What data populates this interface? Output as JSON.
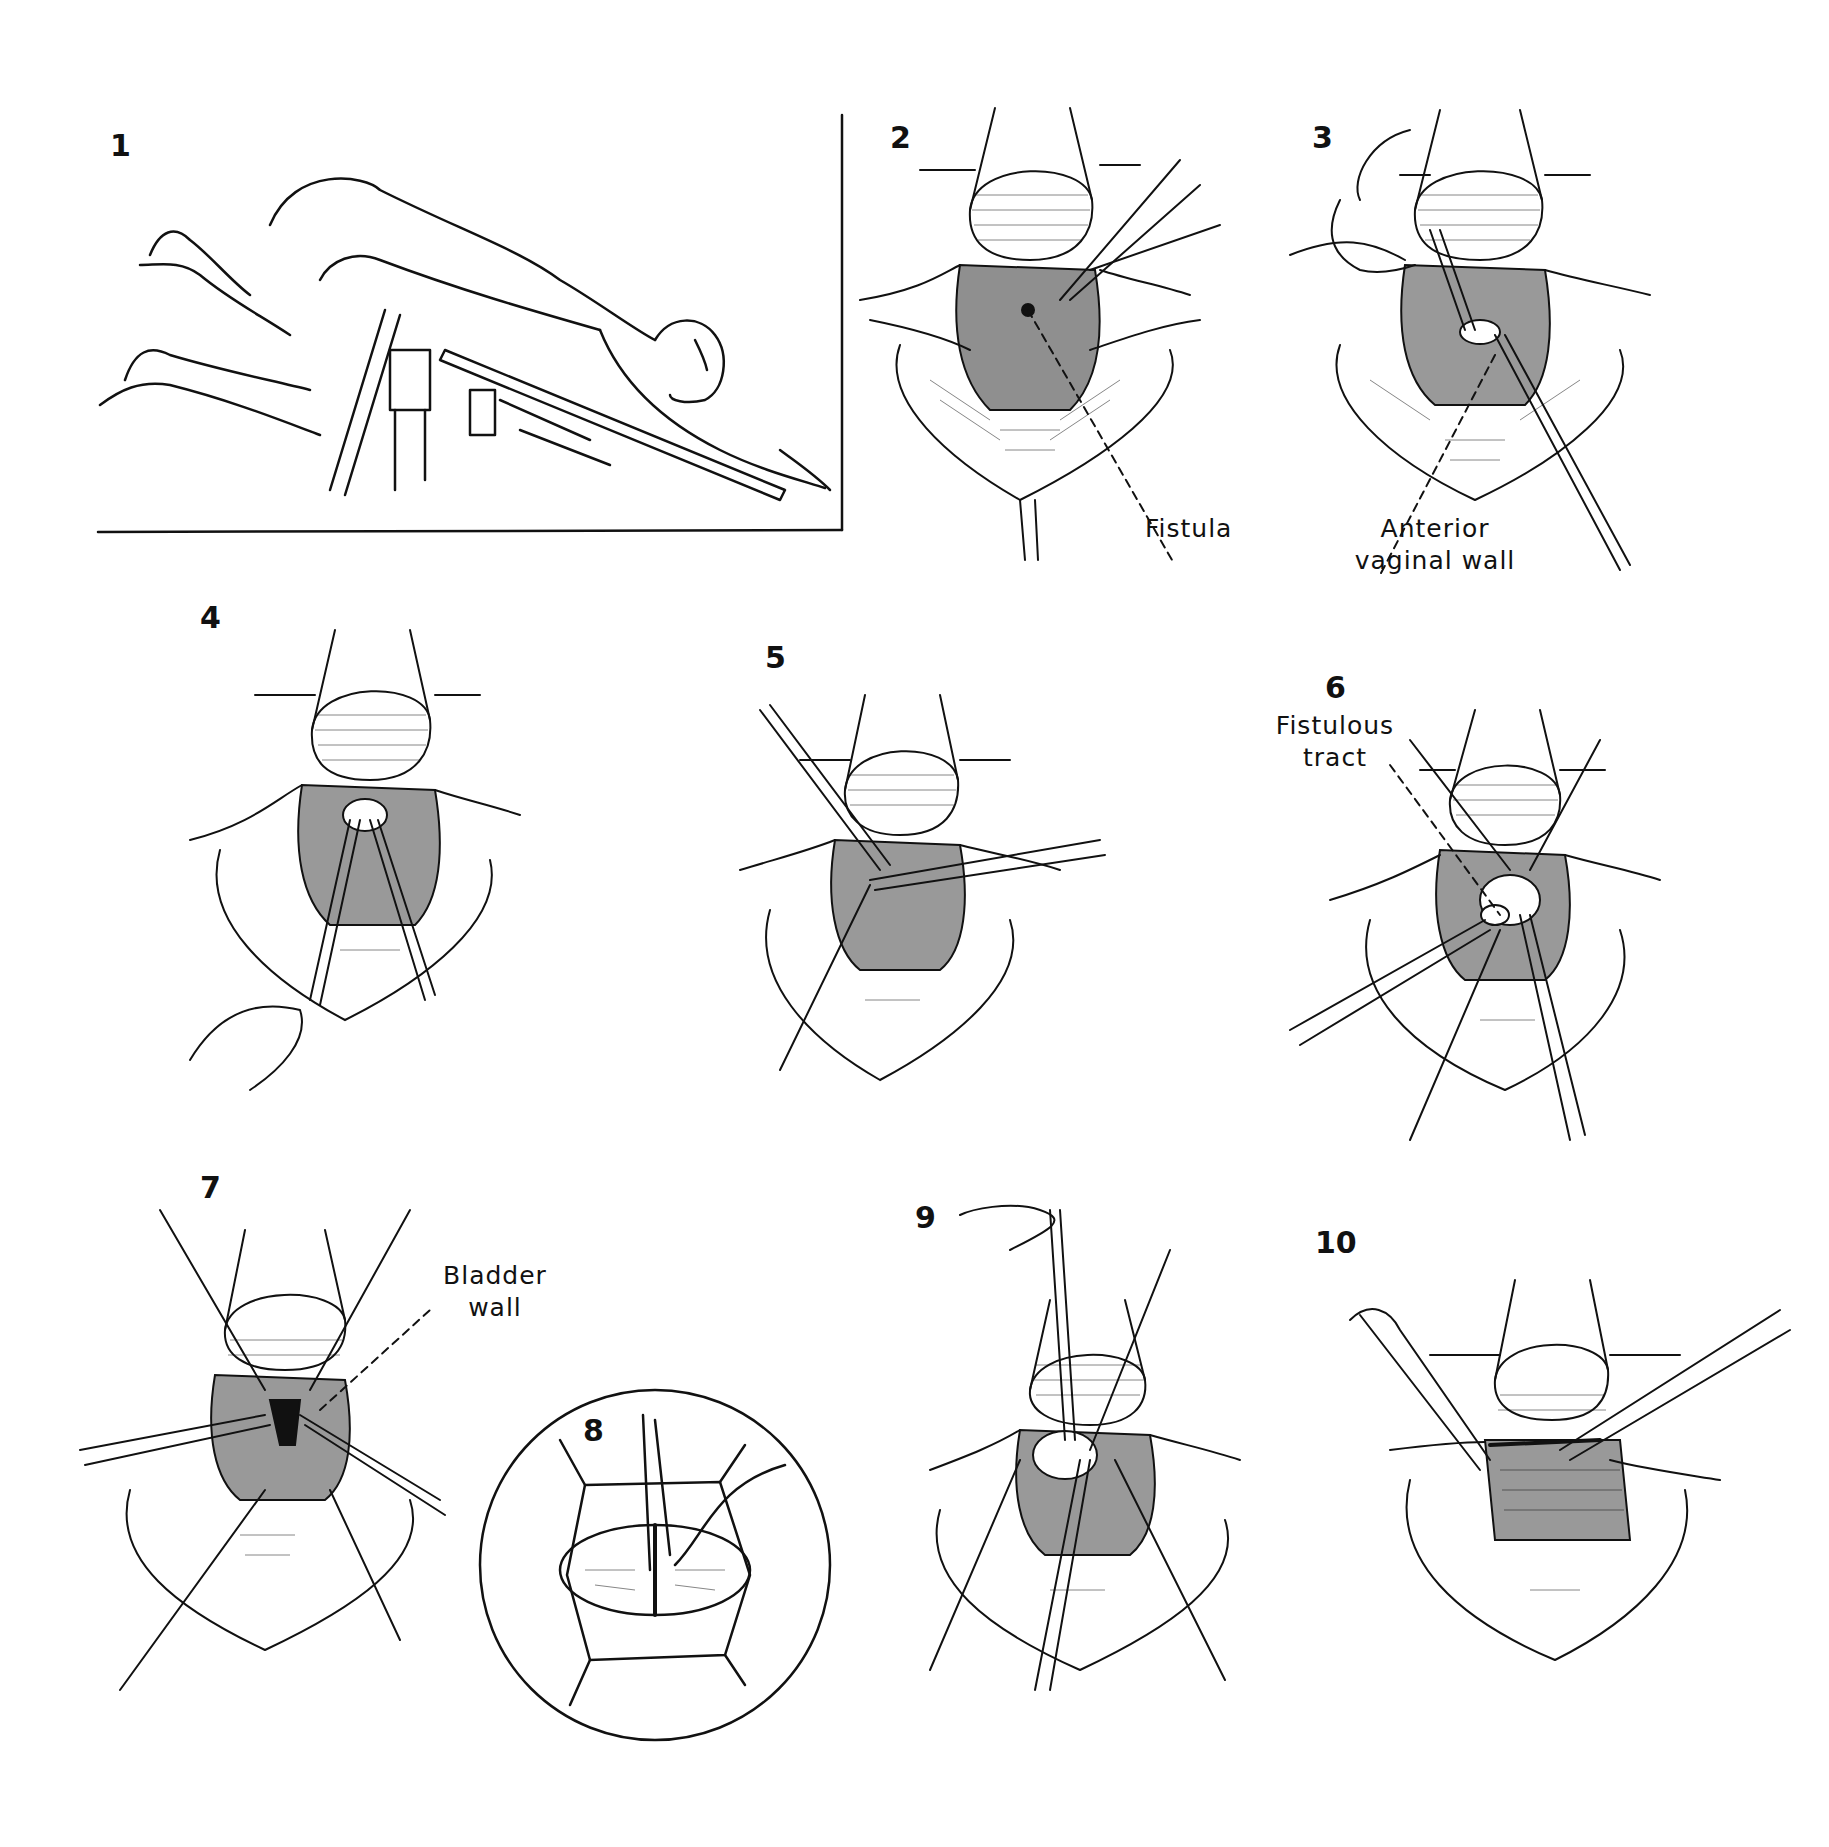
{
  "figure": {
    "type": "surgical-procedure-illustration",
    "panels": [
      {
        "number": "1",
        "description": "patient in prone knee-chest position on operating table"
      },
      {
        "number": "2",
        "label": "Fistula"
      },
      {
        "number": "3",
        "label_line1": "Anterior",
        "label_line2": "vaginal wall"
      },
      {
        "number": "4"
      },
      {
        "number": "5"
      },
      {
        "number": "6",
        "label_line1": "Fistulous",
        "label_line2": "tract"
      },
      {
        "number": "7",
        "label_line1": "Bladder",
        "label_line2": "wall"
      },
      {
        "number": "8",
        "description": "circular inset: closure of bladder wall"
      },
      {
        "number": "9"
      },
      {
        "number": "10"
      }
    ]
  },
  "colors": {
    "ink": "#111111",
    "background": "#ffffff"
  }
}
